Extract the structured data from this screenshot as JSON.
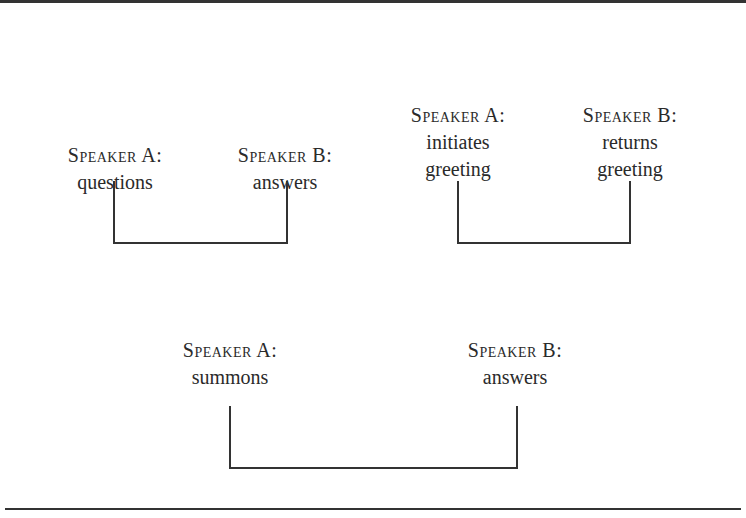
{
  "diagram": {
    "pairs": [
      {
        "a": {
          "speaker": "Speaker A:",
          "action": [
            "questions"
          ]
        },
        "b": {
          "speaker": "Speaker B:",
          "action": [
            "answers"
          ]
        }
      },
      {
        "a": {
          "speaker": "Speaker A:",
          "action": [
            "initiates",
            "greeting"
          ]
        },
        "b": {
          "speaker": "Speaker B:",
          "action": [
            "returns",
            "greeting"
          ]
        }
      },
      {
        "a": {
          "speaker": "Speaker A:",
          "action": [
            "summons"
          ]
        },
        "b": {
          "speaker": "Speaker B:",
          "action": [
            "answers"
          ]
        }
      }
    ]
  }
}
